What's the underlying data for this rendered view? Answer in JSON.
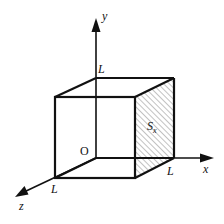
{
  "diagram": {
    "type": "3d-cube-with-axes",
    "axes": {
      "x": {
        "label": "x"
      },
      "y": {
        "label": "y"
      },
      "z": {
        "label": "z"
      }
    },
    "origin_label": "O",
    "edge_labels": {
      "y_edge": "L",
      "x_edge": "L",
      "z_edge": "L"
    },
    "shaded_face": {
      "label_main": "S",
      "label_sub": "x",
      "description": "hatched face perpendicular to x-axis"
    },
    "colors": {
      "stroke": "#111111",
      "background": "#ffffff",
      "hatch": "#555555"
    }
  }
}
